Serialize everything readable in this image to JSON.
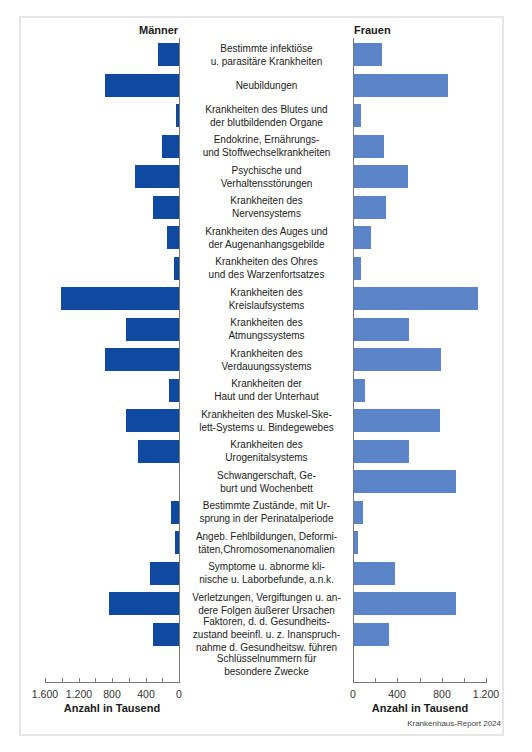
{
  "chart_data": {
    "type": "bar",
    "orientation": "horizontal",
    "layout": "population-pyramid (two-sided, shared category labels in center)",
    "title": "",
    "series": [
      {
        "name": "Männer",
        "color": "#0f4aa0",
        "side": "left",
        "values": [
          250,
          880,
          40,
          200,
          525,
          310,
          145,
          60,
          1410,
          630,
          885,
          120,
          630,
          490,
          0,
          95,
          50,
          345,
          835,
          310,
          0
        ]
      },
      {
        "name": "Frauen",
        "color": "#5b84c9",
        "side": "right",
        "values": [
          250,
          845,
          60,
          270,
          485,
          290,
          150,
          60,
          1115,
          495,
          785,
          100,
          775,
          495,
          920,
          80,
          35,
          370,
          920,
          315,
          0
        ]
      }
    ],
    "categories": [
      "Bestimmte infektiöse u. parasitäre Krankheiten",
      "Neubildungen",
      "Krankheiten des Blutes und der blutbildenden Organe",
      "Endokrine, Ernährungs- und Stoffwechselkrankheiten",
      "Psychische und Verhaltensstörungen",
      "Krankheiten des Nervensystems",
      "Krankheiten des Auges und der Augenanhangsgebilde",
      "Krankheiten des Ohres und des Warzenfortsatzes",
      "Krankheiten des Kreislaufsystems",
      "Krankheiten des Atmungssystems",
      "Krankheiten des Verdauungssystems",
      "Krankheiten der Haut und der Unterhaut",
      "Krankheiten des Muskel-Skelett-Systems u. Bindegewebes",
      "Krankheiten des Urogenitalsystems",
      "Schwangerschaft, Geburt und Wochenbett",
      "Bestimmte Zustände, mit Ursprung in der Perinatalperiode",
      "Angeb. Fehlbildungen, Deformitäten,Chromosomenanomalien",
      "Symptome u. abnorme klinische u. Laborbefunde, a.n.k.",
      "Verletzungen, Vergiftungen u. andere Folgen äußerer Ursachen",
      "Faktoren, d. d. Gesundheitszustand beeinfl. u. z. Inanspruchnahme d. Gesundheitsw. führen",
      "Schlüsselnummern für besondere Zwecke"
    ],
    "xlabel_left": "Anzahl in Tausend",
    "xlabel_right": "Anzahl in Tausend",
    "xlim_left": [
      1600,
      0
    ],
    "xlim_right": [
      0,
      1200
    ],
    "grid": false,
    "legend": "series labels at top of each side"
  },
  "header": {
    "left_label": "Männer",
    "right_label": "Frauen"
  },
  "category_lines": [
    [
      "Bestimmte infektiöse",
      "u. parasitäre Krankheiten"
    ],
    [
      "Neubildungen"
    ],
    [
      "Krankheiten des Blutes und",
      "der blutbildenden Organe"
    ],
    [
      "Endokrine, Ernährungs-",
      "und Stoffwechselkrankheiten"
    ],
    [
      "Psychische und",
      "Verhaltensstörungen"
    ],
    [
      "Krankheiten des",
      "Nervensystems"
    ],
    [
      "Krankheiten des Auges und",
      "der Augenanhangsgebilde"
    ],
    [
      "Krankheiten des Ohres",
      "und des Warzenfortsatzes"
    ],
    [
      "Krankheiten des",
      "Kreislaufsystems"
    ],
    [
      "Krankheiten des",
      "Atmungssystems"
    ],
    [
      "Krankheiten des",
      "Verdauungssystems"
    ],
    [
      "Krankheiten der",
      "Haut und der Unterhaut"
    ],
    [
      "Krankheiten des Muskel-Ske-",
      "lett-Systems u. Bindegewebes"
    ],
    [
      "Krankheiten des",
      "Urogenitalsystems"
    ],
    [
      "Schwangerschaft, Ge-",
      "burt und Wochenbett"
    ],
    [
      "Bestimmte Zustände, mit Ur-",
      "sprung in der Perinatalperiode"
    ],
    [
      "Angeb. Fehlbildungen, Deformi-",
      "täten,Chromosomenanomalien"
    ],
    [
      "Symptome u. abnorme kli-",
      "nische u. Laborbefunde, a.n.k."
    ],
    [
      "Verletzungen, Vergiftungen u. an-",
      "dere Folgen äußerer Ursachen"
    ],
    [
      "Faktoren, d. d. Gesundheits-",
      "zustand beeinfl. u. z. Inanspruch-",
      "nahme d. Gesundheitsw. führen"
    ],
    [
      "Schlüsselnummern für",
      "besondere Zwecke"
    ]
  ],
  "axes": {
    "left_ticks": [
      "1.600",
      "1.200",
      "800",
      "400",
      "0"
    ],
    "right_ticks": [
      "0",
      "400",
      "800",
      "1.200"
    ],
    "left_title": "Anzahl in Tausend",
    "right_title": "Anzahl in Tausend"
  },
  "source": "Krankenhaus-Report 2024"
}
